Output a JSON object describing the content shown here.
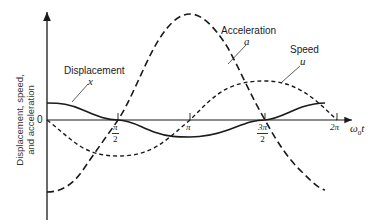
{
  "figure": {
    "y_axis_label_line1": "Displacement, speed,",
    "y_axis_label_line2": "and acceleration",
    "x_axis_label_prefix": "ω",
    "x_axis_label_sub": "0",
    "x_axis_label_suffix": "t",
    "origin_label": "0",
    "ticks": {
      "pi_over_2": {
        "num": "π",
        "den": "2"
      },
      "pi": {
        "label": "π"
      },
      "three_pi_over_2": {
        "num": "3π",
        "den": "2"
      },
      "two_pi": {
        "label": "2π"
      }
    },
    "curves": {
      "displacement": {
        "name": "Displacement",
        "symbol": "x",
        "style": "solid"
      },
      "acceleration": {
        "name": "Acceleration",
        "symbol": "a",
        "style": "long-dash"
      },
      "speed": {
        "name": "Speed",
        "symbol": "u",
        "style": "short-dash"
      }
    },
    "colors": {
      "ink": "#1a1a1a",
      "background": "#ffffff"
    }
  }
}
